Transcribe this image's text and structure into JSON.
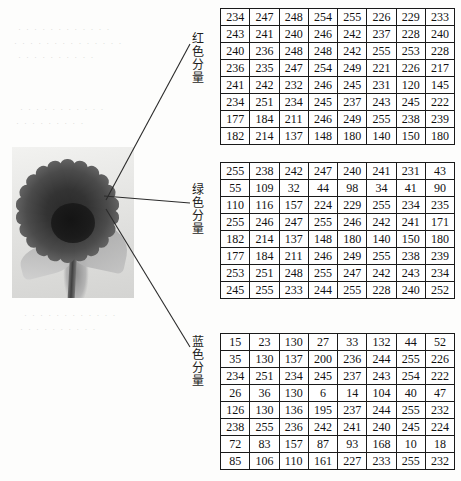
{
  "figure": {
    "photo": {
      "alt_name": "sunflower-grayscale-photo",
      "subject": "sunflower"
    },
    "ghost_text_lines": [
      "· · · · · · · · · · · ·",
      "· · · · · · · · · · · · · ·",
      "· · · · · · · · · ·",
      "· · · · · · · · · · ·",
      "· · · · · · · · ·"
    ]
  },
  "labels": {
    "red": "红\n色\n分\n量",
    "green": "绿\n色\n分\n量",
    "blue": "蓝\n色\n分\n量"
  },
  "chart_data": [
    {
      "type": "table",
      "title": "红色分量",
      "name": "red-component-matrix",
      "rows": 8,
      "cols": 8,
      "values": [
        [
          234,
          247,
          248,
          254,
          255,
          226,
          229,
          233
        ],
        [
          243,
          241,
          240,
          246,
          242,
          237,
          228,
          240
        ],
        [
          240,
          236,
          248,
          248,
          242,
          255,
          253,
          228
        ],
        [
          236,
          235,
          247,
          254,
          249,
          221,
          226,
          217
        ],
        [
          241,
          242,
          232,
          246,
          245,
          231,
          120,
          145
        ],
        [
          234,
          251,
          234,
          245,
          237,
          243,
          245,
          222
        ],
        [
          177,
          184,
          211,
          246,
          249,
          255,
          238,
          239
        ],
        [
          182,
          214,
          137,
          148,
          180,
          140,
          150,
          180
        ]
      ]
    },
    {
      "type": "table",
      "title": "绿色分量",
      "name": "green-component-matrix",
      "rows": 8,
      "cols": 8,
      "values": [
        [
          255,
          238,
          242,
          247,
          240,
          241,
          231,
          43
        ],
        [
          55,
          109,
          32,
          44,
          98,
          34,
          41,
          90
        ],
        [
          110,
          116,
          157,
          224,
          229,
          255,
          234,
          235
        ],
        [
          255,
          246,
          247,
          255,
          246,
          242,
          241,
          171
        ],
        [
          182,
          214,
          137,
          148,
          180,
          140,
          150,
          180
        ],
        [
          177,
          184,
          211,
          246,
          249,
          255,
          238,
          239
        ],
        [
          253,
          251,
          248,
          255,
          247,
          242,
          243,
          234
        ],
        [
          245,
          255,
          233,
          244,
          255,
          228,
          240,
          252
        ]
      ]
    },
    {
      "type": "table",
      "title": "蓝色分量",
      "name": "blue-component-matrix",
      "rows": 8,
      "cols": 8,
      "values": [
        [
          15,
          23,
          130,
          27,
          33,
          132,
          44,
          52
        ],
        [
          35,
          130,
          137,
          200,
          236,
          244,
          255,
          226
        ],
        [
          234,
          251,
          234,
          245,
          237,
          243,
          254,
          222
        ],
        [
          26,
          36,
          130,
          6,
          14,
          104,
          40,
          47
        ],
        [
          126,
          130,
          136,
          195,
          237,
          244,
          255,
          232
        ],
        [
          238,
          255,
          236,
          242,
          241,
          240,
          245,
          224
        ],
        [
          72,
          83,
          157,
          87,
          93,
          168,
          10,
          18
        ],
        [
          85,
          106,
          110,
          161,
          227,
          233,
          255,
          232
        ]
      ]
    }
  ]
}
